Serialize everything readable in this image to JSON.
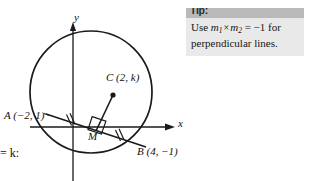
{
  "figure": {
    "type": "geometry-diagram",
    "axis_labels": {
      "x": "x",
      "y": "y"
    },
    "points": [
      {
        "name": "A",
        "label": "A (−2, 1)",
        "x": -2,
        "y": 1
      },
      {
        "name": "B",
        "label": "B (4, −1)",
        "x": 4,
        "y": -1
      },
      {
        "name": "C",
        "label": "C (2, k)",
        "x": 2,
        "y": "k",
        "is_centre": true,
        "dot": true
      },
      {
        "name": "M",
        "label": "M",
        "is_midpoint": true
      }
    ],
    "clipped_text": "= k:",
    "marks": {
      "right_angle": "square at M between CM and AB",
      "equal_tick_count": 2
    }
  },
  "tip": {
    "header_label": "Tip:",
    "line1_pre": "Use ",
    "line1_m1": "m",
    "line1_m1_sub": "1",
    "line1_times": "×",
    "line1_m2": "m",
    "line1_m2_sub": "2",
    "line1_eq": " = −1 for",
    "line2": "perpendicular lines.",
    "full_text": "Use m1 × m2 = −1 for perpendicular lines."
  },
  "colors": {
    "stroke": "#1a1a1a",
    "tip_header_bg": "#b9b9b9",
    "tip_body_bg": "#e9e9e9",
    "page_bg": "#ffffff"
  }
}
